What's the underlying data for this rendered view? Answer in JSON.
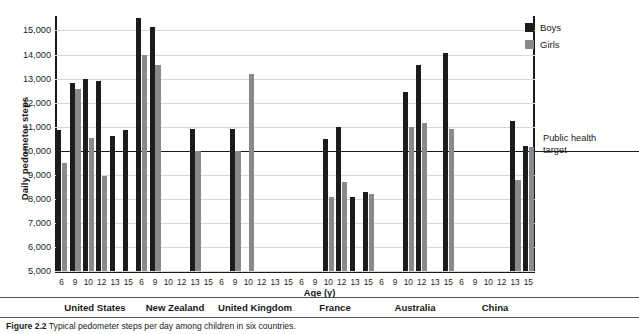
{
  "figure": {
    "caption_label": "Figure 2.2",
    "caption_text": "Typical pedometer steps per day among children in six countries."
  },
  "axes": {
    "y_title": "Daily pedometer steps",
    "x_title": "Age (y)",
    "y_ticks": [
      "15,000",
      "14,000",
      "13,000",
      "12,000",
      "11,000",
      "10,000",
      "9,000",
      "8,000",
      "7,000",
      "6,000",
      "5,000"
    ],
    "y_min": 5000,
    "y_max": 15600,
    "grid": true
  },
  "legend": {
    "position": "top-right",
    "items": [
      {
        "label": "Boys",
        "color": "#1c1c1c"
      },
      {
        "label": "Girls",
        "color": "#8a8a8a"
      }
    ]
  },
  "annotation": {
    "target_line_label": "Public health target",
    "target_line_value": 10000
  },
  "countries": [
    "United States",
    "New Zealand",
    "United Kingdom",
    "France",
    "Australia",
    "China"
  ],
  "ages": [
    "6",
    "9",
    "10",
    "12",
    "13",
    "15"
  ],
  "chart_data": {
    "type": "bar",
    "title": "Typical pedometer steps per day among children in six countries",
    "xlabel": "Age (y)",
    "ylabel": "Daily pedometer steps",
    "ylim": [
      5000,
      15600
    ],
    "grid": true,
    "legend_position": "top-right",
    "reference_line": {
      "label": "Public health target",
      "value": 10000
    },
    "categories": [
      "6",
      "9",
      "10",
      "12",
      "13",
      "15"
    ],
    "groups": [
      {
        "name": "United States",
        "series": [
          {
            "name": "Boys",
            "values": [
              10850,
              12800,
              13000,
              12900,
              10600,
              10850
            ]
          },
          {
            "name": "Girls",
            "values": [
              9500,
              12550,
              10550,
              8950,
              null,
              null
            ]
          }
        ]
      },
      {
        "name": "New Zealand",
        "series": [
          {
            "name": "Boys",
            "values": [
              15500,
              15150,
              null,
              null,
              10900,
              null
            ]
          },
          {
            "name": "Girls",
            "values": [
              14000,
              13550,
              null,
              null,
              10000,
              null
            ]
          }
        ]
      },
      {
        "name": "United Kingdom",
        "series": [
          {
            "name": "Boys",
            "values": [
              null,
              10900,
              null,
              null,
              null,
              null
            ]
          },
          {
            "name": "Girls",
            "values": [
              null,
              10000,
              13200,
              null,
              null,
              null
            ]
          }
        ]
      },
      {
        "name": "France",
        "series": [
          {
            "name": "Boys",
            "values": [
              null,
              null,
              10500,
              11000,
              8100,
              8300
            ]
          },
          {
            "name": "Girls",
            "values": [
              null,
              null,
              8100,
              8700,
              null,
              8200
            ]
          }
        ]
      },
      {
        "name": "Australia",
        "series": [
          {
            "name": "Boys",
            "values": [
              null,
              null,
              12450,
              13550,
              null,
              14050
            ]
          },
          {
            "name": "Girls",
            "values": [
              null,
              null,
              11000,
              11150,
              null,
              10900
            ]
          }
        ]
      },
      {
        "name": "China",
        "series": [
          {
            "name": "Boys",
            "values": [
              null,
              null,
              null,
              null,
              11250,
              10200
            ]
          },
          {
            "name": "Girls",
            "values": [
              null,
              null,
              null,
              null,
              8800,
              10150
            ]
          }
        ]
      }
    ]
  }
}
